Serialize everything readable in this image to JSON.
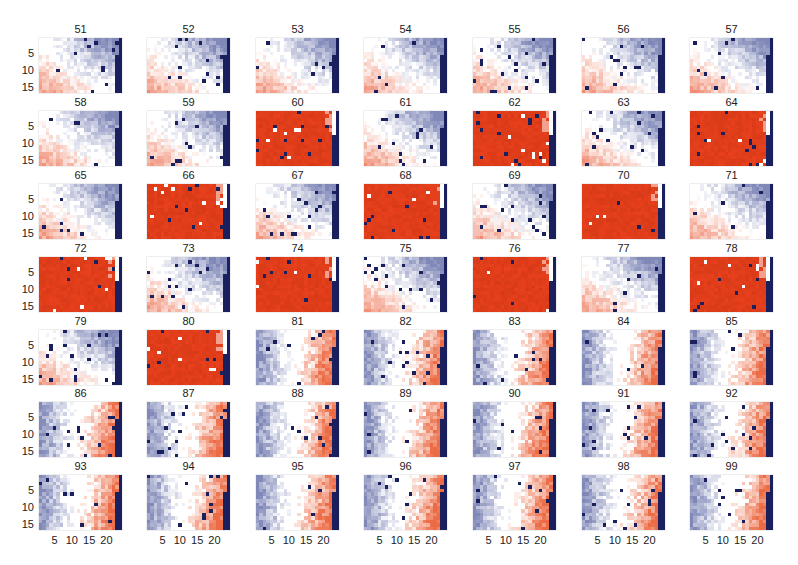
{
  "chart_data": {
    "type": "heatmap",
    "title": "",
    "layout": {
      "rows": 7,
      "cols": 7,
      "grid": false
    },
    "panel_grid": {
      "x_cells": 24,
      "y_cells": 16
    },
    "xlabel": "",
    "ylabel": "",
    "x_ticks": [
      "5",
      "10",
      "15",
      "20"
    ],
    "y_ticks": [
      "5",
      "10",
      "15"
    ],
    "colormap": {
      "low": "#1a1f5e",
      "mid": "#ffffff",
      "high": "#e8401c"
    },
    "panel_types": {
      "blue_upper_right": "mostly white with blue in upper-right and light red in lower-left, navy stripe at right edge",
      "saturated_red": "nearly fully saturated red with sparse outliers, navy stripe at right edge",
      "blue_left_red_right": "blue on left columns, red on right columns, navy stripe at right edge"
    },
    "panels": [
      {
        "label": "51",
        "type": "blue_upper_right"
      },
      {
        "label": "52",
        "type": "blue_upper_right"
      },
      {
        "label": "53",
        "type": "blue_upper_right"
      },
      {
        "label": "54",
        "type": "blue_upper_right"
      },
      {
        "label": "55",
        "type": "blue_upper_right"
      },
      {
        "label": "56",
        "type": "blue_upper_right"
      },
      {
        "label": "57",
        "type": "blue_upper_right"
      },
      {
        "label": "58",
        "type": "blue_upper_right"
      },
      {
        "label": "59",
        "type": "blue_upper_right"
      },
      {
        "label": "60",
        "type": "saturated_red"
      },
      {
        "label": "61",
        "type": "blue_upper_right"
      },
      {
        "label": "62",
        "type": "saturated_red"
      },
      {
        "label": "63",
        "type": "blue_upper_right"
      },
      {
        "label": "64",
        "type": "saturated_red"
      },
      {
        "label": "65",
        "type": "blue_upper_right"
      },
      {
        "label": "66",
        "type": "saturated_red"
      },
      {
        "label": "67",
        "type": "blue_upper_right"
      },
      {
        "label": "68",
        "type": "saturated_red"
      },
      {
        "label": "69",
        "type": "blue_upper_right"
      },
      {
        "label": "70",
        "type": "saturated_red"
      },
      {
        "label": "71",
        "type": "blue_upper_right"
      },
      {
        "label": "72",
        "type": "saturated_red"
      },
      {
        "label": "73",
        "type": "blue_upper_right"
      },
      {
        "label": "74",
        "type": "saturated_red"
      },
      {
        "label": "75",
        "type": "blue_upper_right"
      },
      {
        "label": "76",
        "type": "saturated_red"
      },
      {
        "label": "77",
        "type": "blue_upper_right"
      },
      {
        "label": "78",
        "type": "saturated_red"
      },
      {
        "label": "79",
        "type": "blue_upper_right"
      },
      {
        "label": "80",
        "type": "saturated_red"
      },
      {
        "label": "81",
        "type": "blue_left_red_right"
      },
      {
        "label": "82",
        "type": "blue_left_red_right"
      },
      {
        "label": "83",
        "type": "blue_left_red_right"
      },
      {
        "label": "84",
        "type": "blue_left_red_right"
      },
      {
        "label": "85",
        "type": "blue_left_red_right"
      },
      {
        "label": "86",
        "type": "blue_left_red_right"
      },
      {
        "label": "87",
        "type": "blue_left_red_right"
      },
      {
        "label": "88",
        "type": "blue_left_red_right"
      },
      {
        "label": "89",
        "type": "blue_left_red_right"
      },
      {
        "label": "90",
        "type": "blue_left_red_right"
      },
      {
        "label": "91",
        "type": "blue_left_red_right"
      },
      {
        "label": "92",
        "type": "blue_left_red_right"
      },
      {
        "label": "93",
        "type": "blue_left_red_right"
      },
      {
        "label": "94",
        "type": "blue_left_red_right"
      },
      {
        "label": "95",
        "type": "blue_left_red_right"
      },
      {
        "label": "96",
        "type": "blue_left_red_right"
      },
      {
        "label": "97",
        "type": "blue_left_red_right"
      },
      {
        "label": "98",
        "type": "blue_left_red_right"
      },
      {
        "label": "99",
        "type": "blue_left_red_right"
      }
    ]
  },
  "layout_px": {
    "col_x": [
      39,
      147,
      256,
      364,
      473,
      582,
      690
    ],
    "row_y": [
      38,
      111,
      184,
      257,
      330,
      402,
      475
    ]
  }
}
